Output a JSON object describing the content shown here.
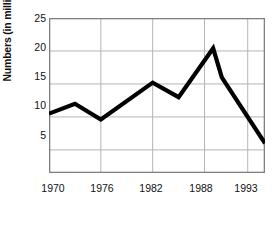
{
  "chart_data": {
    "type": "line",
    "title": "",
    "xlabel": "Year",
    "ylabel": "Numbers (in millions)",
    "xlim": [
      1970,
      1995
    ],
    "ylim": [
      1.5,
      25
    ],
    "xticks": [
      1970,
      1976,
      1982,
      1988,
      1993
    ],
    "xtick_labels": [
      "1970",
      "1976",
      "1982",
      "1988",
      "1993"
    ],
    "yticks": [
      5,
      10,
      15,
      20,
      25
    ],
    "ytick_labels": [
      "5",
      "10",
      "15",
      "20",
      "25"
    ],
    "grid": true,
    "legend": false,
    "line_color": "#000000",
    "grid_color": "#b4b4b4",
    "border_color": "#808080",
    "x": [
      1970,
      1973,
      1976,
      1982,
      1985,
      1989,
      1990,
      1995
    ],
    "values": [
      10.5,
      12.0,
      9.6,
      15.2,
      13.0,
      20.4,
      16.0,
      6.0
    ],
    "series": [
      {
        "name": "Numbers",
        "x": [
          1970,
          1973,
          1976,
          1982,
          1985,
          1989,
          1990,
          1995
        ],
        "values": [
          10.5,
          12.0,
          9.6,
          15.2,
          13.0,
          20.4,
          16.0,
          6.0
        ]
      }
    ]
  }
}
